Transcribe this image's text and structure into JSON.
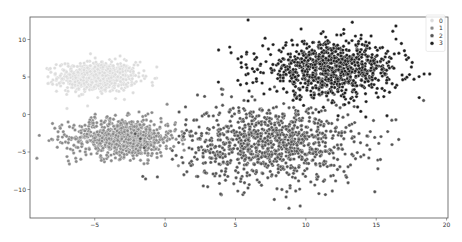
{
  "chart_data": {
    "type": "scatter",
    "title": "",
    "xlabel": "",
    "ylabel": "",
    "xlim": [
      -9.6,
      20.1
    ],
    "ylim": [
      -13.8,
      13.0
    ],
    "xticks": [
      -5,
      0,
      5,
      10,
      15,
      20
    ],
    "xtick_labels": [
      "−5",
      "0",
      "5",
      "10",
      "15",
      "20"
    ],
    "yticks": [
      -10,
      -5,
      0,
      5,
      10
    ],
    "ytick_labels": [
      "−10",
      "−5",
      "0",
      "5",
      "10"
    ],
    "grid": false,
    "legend": {
      "placement": "top-right",
      "entries": [
        "0",
        "1",
        "2",
        "3"
      ]
    },
    "series": [
      {
        "name": "0",
        "color": "#dcdcdc",
        "center": [
          -4.8,
          5.0
        ],
        "spread": [
          1.4,
          1.0
        ],
        "count": 700,
        "points": [
          [
            -7.8,
            5.4
          ],
          [
            -7.2,
            5.9
          ],
          [
            -6.6,
            4.0
          ],
          [
            -5.3,
            8.1
          ],
          [
            -3.2,
            7.8
          ],
          [
            -2.2,
            6.6
          ],
          [
            -6.9,
            3.1
          ]
        ]
      },
      {
        "name": "1",
        "color": "#8a8a8a",
        "center": [
          -3.0,
          -3.1
        ],
        "spread": [
          1.9,
          1.3
        ],
        "count": 800,
        "points": [
          [
            -8.0,
            -1.2
          ],
          [
            -7.6,
            -2.3
          ],
          [
            -6.8,
            -6.6
          ],
          [
            -7.0,
            -2.9
          ],
          [
            -6.2,
            -4.4
          ],
          [
            0.2,
            -1.5
          ],
          [
            -1.2,
            -6.1
          ]
        ]
      },
      {
        "name": "2",
        "color": "#555555",
        "center": [
          7.5,
          -3.8
        ],
        "spread": [
          3.0,
          2.6
        ],
        "count": 1000,
        "points": [
          [
            8.8,
            -12.5
          ],
          [
            9.6,
            -12.2
          ],
          [
            8.6,
            -11.0
          ],
          [
            8.3,
            -10.0
          ],
          [
            14.9,
            -10.3
          ],
          [
            13.0,
            -9.1
          ],
          [
            2.3,
            2.6
          ],
          [
            1.5,
            -0.7
          ],
          [
            4.0,
            3.4
          ],
          [
            16.4,
            -0.7
          ]
        ]
      },
      {
        "name": "3",
        "color": "#1e1e1e",
        "center": [
          11.8,
          6.0
        ],
        "spread": [
          2.4,
          1.8
        ],
        "count": 900,
        "points": [
          [
            5.9,
            12.6
          ],
          [
            5.8,
            8.3
          ],
          [
            5.4,
            6.9
          ],
          [
            6.5,
            7.6
          ],
          [
            6.2,
            6.1
          ],
          [
            18.4,
            5.4
          ],
          [
            18.8,
            5.4
          ],
          [
            16.4,
            11.8
          ],
          [
            13.3,
            12.3
          ],
          [
            3.8,
            8.6
          ],
          [
            17.0,
            8.5
          ]
        ]
      }
    ]
  }
}
